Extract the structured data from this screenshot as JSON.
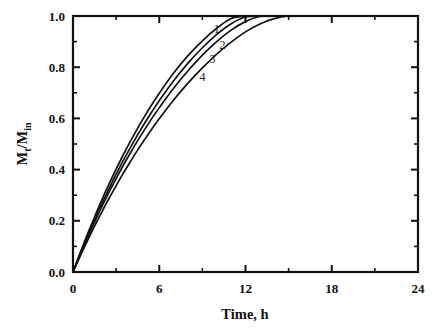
{
  "figure": {
    "background": "#ffffff",
    "ink_color": "#111111"
  },
  "chart_data": {
    "type": "line",
    "title": "",
    "subtitle": "",
    "xlabel": "Time, h",
    "ylabel": "Mt/Min",
    "ylabel_parts": {
      "m1": "M",
      "sub1": "t",
      "slash": "/",
      "m2": "M",
      "sub2": "in"
    },
    "xlim": [
      0,
      24
    ],
    "ylim": [
      0,
      1.0
    ],
    "xticks": [
      0,
      6,
      12,
      18,
      24
    ],
    "xtick_labels": [
      "0",
      "6",
      "12",
      "18",
      "24"
    ],
    "xminor_ticks": [
      3,
      9,
      15,
      21
    ],
    "yticks": [
      0.0,
      0.2,
      0.4,
      0.6,
      0.8,
      1.0
    ],
    "ytick_labels": [
      "0.0",
      "0.2",
      "0.4",
      "0.6",
      "0.8",
      "1.0"
    ],
    "yminor_ticks": [
      0.1,
      0.3,
      0.5,
      0.7,
      0.9
    ],
    "grid": false,
    "legend_position": "inline-curve-labels",
    "x": [
      0,
      0.5,
      1,
      1.5,
      2,
      2.5,
      3,
      3.5,
      4,
      4.5,
      5,
      5.5,
      6,
      7,
      8,
      9,
      10,
      11,
      12,
      13,
      14,
      15,
      16,
      17,
      18,
      19,
      20,
      21,
      22,
      23,
      24
    ],
    "series": [
      {
        "name": "1",
        "label": "1",
        "label_x": 10.0,
        "label_y": 0.935,
        "values": [
          0.0,
          0.075,
          0.147,
          0.215,
          0.281,
          0.343,
          0.402,
          0.458,
          0.511,
          0.562,
          0.61,
          0.655,
          0.698,
          0.777,
          0.845,
          0.903,
          0.952,
          0.99,
          1.0,
          1.0,
          1.0,
          1.0,
          1.0,
          1.0,
          1.0,
          1.0,
          1.0,
          1.0,
          1.0,
          1.0,
          1.0
        ]
      },
      {
        "name": "2",
        "label": "2",
        "label_x": 10.4,
        "label_y": 0.872,
        "values": [
          0.0,
          0.071,
          0.139,
          0.204,
          0.266,
          0.325,
          0.382,
          0.436,
          0.487,
          0.536,
          0.583,
          0.627,
          0.669,
          0.747,
          0.816,
          0.876,
          0.928,
          0.97,
          0.996,
          1.0,
          1.0,
          1.0,
          1.0,
          1.0,
          1.0,
          1.0,
          1.0,
          1.0,
          1.0,
          1.0,
          1.0
        ]
      },
      {
        "name": "3",
        "label": "3",
        "label_x": 9.7,
        "label_y": 0.815,
        "values": [
          0.0,
          0.068,
          0.133,
          0.195,
          0.254,
          0.311,
          0.365,
          0.417,
          0.466,
          0.513,
          0.558,
          0.601,
          0.642,
          0.718,
          0.786,
          0.847,
          0.9,
          0.945,
          0.978,
          0.998,
          1.0,
          1.0,
          1.0,
          1.0,
          1.0,
          1.0,
          1.0,
          1.0,
          1.0,
          1.0,
          1.0
        ]
      },
      {
        "name": "4",
        "label": "4",
        "label_x": 9.0,
        "label_y": 0.745,
        "values": [
          0.0,
          0.062,
          0.122,
          0.179,
          0.234,
          0.287,
          0.337,
          0.386,
          0.432,
          0.477,
          0.519,
          0.56,
          0.599,
          0.672,
          0.738,
          0.797,
          0.851,
          0.898,
          0.938,
          0.969,
          0.99,
          1.0,
          1.0,
          1.0,
          1.0,
          1.0,
          1.0,
          1.0,
          1.0,
          1.0,
          1.0
        ]
      }
    ]
  },
  "plot_geometry": {
    "left": 73,
    "top": 16,
    "right": 418,
    "bottom": 272
  }
}
